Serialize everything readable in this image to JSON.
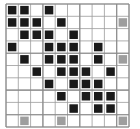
{
  "figure": {
    "name": "grid-matrix-diagram",
    "title": "",
    "width_px": 140,
    "height_px": 129,
    "background_color": "#ffffff"
  },
  "grid": {
    "rows": 10,
    "cols": 10,
    "origin_x": 6,
    "origin_y": 4,
    "cell_size": 12.3,
    "line_color": "#9a9a9a",
    "line_width": 0.8,
    "block_line_color": "#8a8a8a",
    "block_line_width": 1.1,
    "block_divider_rows": [
      0,
      4,
      7,
      9,
      10
    ],
    "block_divider_cols": [
      0,
      3,
      6,
      9,
      10
    ]
  },
  "legend": {
    "filled_label": "filled",
    "highlight_label": "highlight",
    "empty_label": "empty"
  },
  "colors": {
    "filled": "#1a1a1a",
    "highlight": "#9e9e9e",
    "empty": "#ffffff",
    "cell_border": "#ffffff"
  },
  "chart_data": {
    "type": "heatmap",
    "title": "",
    "xlabel": "",
    "ylabel": "",
    "rows": 10,
    "cols": 10,
    "value_legend": {
      "0": "empty",
      "1": "filled",
      "2": "highlight"
    },
    "matrix": [
      [
        1,
        1,
        0,
        1,
        0,
        0,
        0,
        0,
        0,
        0
      ],
      [
        1,
        1,
        1,
        0,
        1,
        0,
        0,
        0,
        0,
        2
      ],
      [
        0,
        1,
        1,
        1,
        0,
        1,
        0,
        0,
        0,
        0
      ],
      [
        1,
        0,
        0,
        1,
        1,
        1,
        0,
        1,
        0,
        0
      ],
      [
        0,
        1,
        0,
        1,
        1,
        1,
        0,
        1,
        0,
        2
      ],
      [
        0,
        0,
        1,
        0,
        1,
        1,
        1,
        0,
        1,
        0
      ],
      [
        0,
        0,
        0,
        1,
        0,
        1,
        1,
        1,
        0,
        0
      ],
      [
        0,
        0,
        0,
        0,
        1,
        0,
        1,
        1,
        1,
        0
      ],
      [
        0,
        0,
        0,
        0,
        0,
        1,
        0,
        1,
        1,
        0
      ],
      [
        0,
        2,
        0,
        0,
        2,
        0,
        0,
        0,
        0,
        2
      ]
    ],
    "filled_cells": [
      [
        0,
        0
      ],
      [
        0,
        1
      ],
      [
        0,
        3
      ],
      [
        1,
        0
      ],
      [
        1,
        1
      ],
      [
        1,
        2
      ],
      [
        1,
        4
      ],
      [
        2,
        1
      ],
      [
        2,
        2
      ],
      [
        2,
        3
      ],
      [
        2,
        5
      ],
      [
        3,
        0
      ],
      [
        3,
        3
      ],
      [
        3,
        4
      ],
      [
        3,
        5
      ],
      [
        3,
        7
      ],
      [
        4,
        1
      ],
      [
        4,
        3
      ],
      [
        4,
        4
      ],
      [
        4,
        5
      ],
      [
        4,
        7
      ],
      [
        5,
        2
      ],
      [
        5,
        4
      ],
      [
        5,
        5
      ],
      [
        5,
        6
      ],
      [
        5,
        8
      ],
      [
        6,
        3
      ],
      [
        6,
        5
      ],
      [
        6,
        6
      ],
      [
        6,
        7
      ],
      [
        7,
        4
      ],
      [
        7,
        6
      ],
      [
        7,
        7
      ],
      [
        7,
        8
      ],
      [
        8,
        5
      ],
      [
        8,
        7
      ],
      [
        8,
        8
      ]
    ],
    "highlight_cells": [
      [
        1,
        9
      ],
      [
        4,
        9
      ],
      [
        9,
        1
      ],
      [
        9,
        4
      ],
      [
        9,
        9
      ]
    ],
    "filled_count": 37,
    "highlight_count": 5,
    "empty_count": 58,
    "grid": true,
    "legend_position": "none"
  }
}
